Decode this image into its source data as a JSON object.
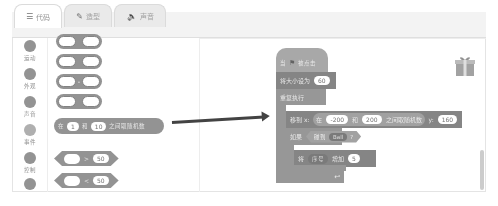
{
  "tabs": [
    {
      "label": "代码",
      "icon": "code-icon",
      "active": true
    },
    {
      "label": "造型",
      "icon": "brush-icon",
      "active": false
    },
    {
      "label": "声音",
      "icon": "speaker-icon",
      "active": false
    }
  ],
  "categories": [
    {
      "label": "运动"
    },
    {
      "label": "外观"
    },
    {
      "label": "声音"
    },
    {
      "label": "事件"
    },
    {
      "label": "控制"
    },
    {
      "label": ""
    }
  ],
  "palette": {
    "random_block": {
      "prefix": "在",
      "from": "1",
      "mid": "和",
      "to": "10",
      "suffix": "之间取随机数"
    },
    "greater_block": {
      "op": ">",
      "value": "50"
    },
    "less_block": {
      "op": "<",
      "value": "50"
    }
  },
  "script": {
    "hat": {
      "prefix": "当",
      "suffix": "被点击"
    },
    "set_size": {
      "label": "将大小设为",
      "value": "60"
    },
    "forever": {
      "label": "重复执行"
    },
    "goto": {
      "label": "移到 x:",
      "rand_prefix": "在",
      "from": "-200",
      "mid": "和",
      "to": "200",
      "rand_suffix": "之间取随机数",
      "y_label": "y:",
      "y": "160"
    },
    "if": {
      "label": "如果",
      "sense": "碰到",
      "target": "Ball",
      "q": "?"
    },
    "change": {
      "prefix": "将",
      "effect": "序号",
      "mid": "增加",
      "value": "5"
    }
  }
}
